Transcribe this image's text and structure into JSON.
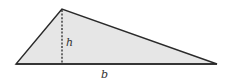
{
  "diagram": {
    "shape": "triangle",
    "vertices": {
      "apex": [
        62,
        9
      ],
      "left": [
        16,
        64
      ],
      "right": [
        217,
        64
      ]
    },
    "height_line": {
      "from": [
        62,
        9
      ],
      "to": [
        62,
        64
      ],
      "style": "dashed"
    },
    "labels": {
      "height": "h",
      "base": "b"
    },
    "colors": {
      "fill": "#e6e6e6",
      "stroke": "#2a2a2a",
      "background": "#ffffff"
    }
  }
}
